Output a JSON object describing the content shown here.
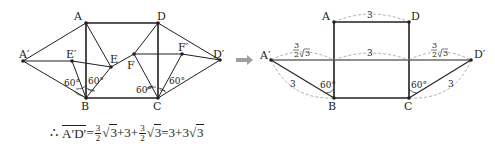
{
  "figure_left": {
    "points": {
      "A": {
        "label": "A",
        "x": 86,
        "y": 23
      },
      "B": {
        "label": "B",
        "x": 86,
        "y": 98
      },
      "C": {
        "label": "C",
        "x": 158,
        "y": 98
      },
      "D": {
        "label": "D",
        "x": 158,
        "y": 23
      },
      "A_prime": {
        "label": "A′",
        "x": 23,
        "y": 61
      },
      "D_prime": {
        "label": "D′",
        "x": 220,
        "y": 60
      },
      "E": {
        "label": "E",
        "x": 111,
        "y": 67
      },
      "E_prime": {
        "label": "E′",
        "x": 72,
        "y": 61
      },
      "F": {
        "label": "F",
        "x": 134,
        "y": 54
      },
      "F_prime": {
        "label": "F′",
        "x": 182,
        "y": 54
      }
    },
    "angles": {
      "B_left": "60°",
      "B_right": "60°",
      "C_left": "60°",
      "C_right": "60°"
    }
  },
  "arrow": {
    "icon": "right-arrow-icon",
    "color": "#9b9b9b"
  },
  "figure_right": {
    "points": {
      "A": {
        "label": "A",
        "x": 334,
        "y": 22
      },
      "B": {
        "label": "B",
        "x": 334,
        "y": 98
      },
      "C": {
        "label": "C",
        "x": 409,
        "y": 98
      },
      "D": {
        "label": "D",
        "x": 409,
        "y": 22
      },
      "A_prime": {
        "label": "A′",
        "x": 271,
        "y": 60
      },
      "D_prime": {
        "label": "D′",
        "x": 471,
        "y": 60
      }
    },
    "dimensions": {
      "AD": "3",
      "middle": "3",
      "A_prime_B": "3",
      "C_D_prime": "3",
      "left_segment_num": "3",
      "left_segment_den": "2",
      "left_segment_rad": "3",
      "right_segment_num": "3",
      "right_segment_den": "2",
      "right_segment_rad": "3"
    },
    "angles": {
      "B": "60°",
      "C": "60°"
    }
  },
  "formula": {
    "therefore": "∴",
    "segment": "A′D′",
    "eq1": "=",
    "frac1_num": "3",
    "frac1_den": "2",
    "rad1": "3",
    "plus1": "+3+",
    "frac2_num": "3",
    "frac2_den": "2",
    "rad2": "3",
    "eq2": "=3+3",
    "rad3": "3"
  }
}
